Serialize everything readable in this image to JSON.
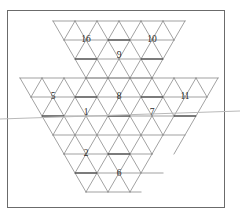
{
  "figure": {
    "canvas": {
      "width": 240,
      "height": 216
    },
    "frame": {
      "x": 7,
      "y": 10,
      "width": 218,
      "height": 198,
      "color": "#6b6b6b"
    },
    "colors": {
      "background": "#ffffff",
      "frame_stroke": "#6b6b6b",
      "lattice_stroke": "#7a7a7a",
      "merge_bar_stroke": "#4a4a4a",
      "fold_line": "#b9b9b9",
      "label_text": "#2b2b2b"
    },
    "lattice": {
      "unit_width": 22,
      "unit_height": 19,
      "origin_x": 53,
      "origin_y": 21
    },
    "fold_line": {
      "description": "faint grey horizontal crease spanning the full image width",
      "x1": 0,
      "y1": 119,
      "x2": 240,
      "y2": 111
    },
    "cells": [
      {
        "id": "cell-16",
        "label": "16",
        "cx": 86,
        "cy": 40,
        "shape": "hexagon"
      },
      {
        "id": "cell-10",
        "label": "10",
        "cx": 152,
        "cy": 40,
        "shape": "hexagon"
      },
      {
        "id": "cell-9",
        "label": "9",
        "cx": 119,
        "cy": 56,
        "shape": "hexagon"
      },
      {
        "id": "cell-5",
        "label": "5",
        "cx": 53,
        "cy": 97,
        "shape": "hexagon"
      },
      {
        "id": "cell-8",
        "label": "8",
        "cx": 119,
        "cy": 97,
        "shape": "hexagon"
      },
      {
        "id": "cell-11",
        "label": "11",
        "cx": 185,
        "cy": 97,
        "shape": "hexagon"
      },
      {
        "id": "cell-1",
        "label": "1",
        "cx": 86,
        "cy": 113,
        "shape": "hexagon"
      },
      {
        "id": "cell-7",
        "label": "7",
        "cx": 152,
        "cy": 113,
        "shape": "hexagon"
      },
      {
        "id": "cell-2",
        "label": "2",
        "cx": 86,
        "cy": 154,
        "shape": "hexagon"
      },
      {
        "id": "cell-6",
        "label": "6",
        "cx": 119,
        "cy": 174,
        "shape": "hexagon"
      }
    ]
  }
}
